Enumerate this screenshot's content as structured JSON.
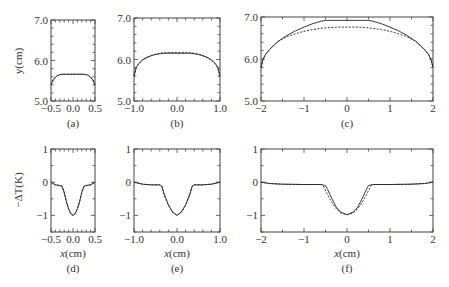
{
  "figure": {
    "ylabel_top": "y(cm)",
    "ylabel_bottom": "−ΔT(K)",
    "xlabel": "x(cm)"
  },
  "chart_data": [
    {
      "id": "a",
      "panel_label": "(a)",
      "type": "line",
      "title": "",
      "xlabel": "",
      "ylabel": "y(cm)",
      "xlim": [
        -0.5,
        0.5
      ],
      "ylim": [
        5.0,
        7.0
      ],
      "xticks": [
        -0.5,
        0.0,
        0.5
      ],
      "xtick_labels": [
        "−0.5",
        "0.0",
        "0.5"
      ],
      "yticks": [
        5.0,
        6.0,
        7.0
      ],
      "ytick_labels": [
        "5.0",
        "6.0",
        "7.0"
      ],
      "x_minor": 0.1,
      "y_minor": 0.2,
      "grid": false,
      "frame": {
        "x": 51,
        "y": 20,
        "w": 44,
        "h": 81
      },
      "series": [
        {
          "name": "solid",
          "style": "solid",
          "x": [
            -0.5,
            -0.45,
            -0.4,
            -0.35,
            -0.3,
            -0.25,
            -0.2,
            -0.1,
            0,
            0.1,
            0.2,
            0.25,
            0.3,
            0.35,
            0.4,
            0.45,
            0.5
          ],
          "y": [
            5.4,
            5.52,
            5.59,
            5.63,
            5.65,
            5.66,
            5.66,
            5.66,
            5.66,
            5.66,
            5.66,
            5.66,
            5.65,
            5.63,
            5.59,
            5.52,
            5.4
          ]
        },
        {
          "name": "dashed",
          "style": "dashed",
          "x": [
            -0.5,
            -0.45,
            -0.4,
            -0.35,
            -0.3,
            -0.25,
            -0.2,
            -0.1,
            0,
            0.1,
            0.2,
            0.25,
            0.3,
            0.35,
            0.4,
            0.45,
            0.5
          ],
          "y": [
            5.4,
            5.52,
            5.59,
            5.63,
            5.65,
            5.66,
            5.66,
            5.66,
            5.66,
            5.66,
            5.66,
            5.66,
            5.65,
            5.63,
            5.59,
            5.52,
            5.4
          ]
        }
      ]
    },
    {
      "id": "b",
      "panel_label": "(b)",
      "type": "line",
      "title": "",
      "xlabel": "",
      "ylabel": "",
      "xlim": [
        -1.0,
        1.0
      ],
      "ylim": [
        5.0,
        7.0
      ],
      "xticks": [
        -1.0,
        0.0,
        1.0
      ],
      "xtick_labels": [
        "−1.0",
        "0.0",
        "1.0"
      ],
      "yticks": [
        5.0,
        6.0,
        7.0
      ],
      "ytick_labels": [
        "5.0",
        "6.0",
        "7.0"
      ],
      "x_minor": 0.2,
      "y_minor": 0.2,
      "grid": false,
      "frame": {
        "x": 134,
        "y": 18,
        "w": 86,
        "h": 83
      },
      "series": [
        {
          "name": "solid",
          "style": "solid",
          "x": [
            -1,
            -0.95,
            -0.9,
            -0.8,
            -0.7,
            -0.6,
            -0.5,
            -0.4,
            -0.3,
            -0.2,
            0,
            0.2,
            0.3,
            0.4,
            0.5,
            0.6,
            0.7,
            0.8,
            0.9,
            0.95,
            1
          ],
          "y": [
            5.6,
            5.8,
            5.89,
            5.99,
            6.05,
            6.09,
            6.12,
            6.14,
            6.15,
            6.15,
            6.15,
            6.15,
            6.15,
            6.14,
            6.12,
            6.09,
            6.05,
            5.99,
            5.89,
            5.8,
            5.6
          ]
        },
        {
          "name": "dashed",
          "style": "dashed",
          "x": [
            -1,
            -0.95,
            -0.9,
            -0.8,
            -0.7,
            -0.6,
            -0.5,
            -0.4,
            -0.3,
            -0.2,
            0,
            0.2,
            0.3,
            0.4,
            0.5,
            0.6,
            0.7,
            0.8,
            0.9,
            0.95,
            1
          ],
          "y": [
            5.6,
            5.8,
            5.89,
            5.99,
            6.05,
            6.1,
            6.13,
            6.15,
            6.16,
            6.17,
            6.17,
            6.17,
            6.16,
            6.15,
            6.13,
            6.1,
            6.05,
            5.99,
            5.89,
            5.8,
            5.6
          ]
        }
      ]
    },
    {
      "id": "c",
      "panel_label": "(c)",
      "type": "line",
      "title": "",
      "xlabel": "",
      "ylabel": "",
      "xlim": [
        -2,
        2
      ],
      "ylim": [
        5.0,
        7.0
      ],
      "xticks": [
        -2,
        -1,
        0,
        1,
        2
      ],
      "xtick_labels": [
        "−2",
        "−1",
        "0",
        "1",
        "2"
      ],
      "yticks": [
        5.0,
        6.0,
        7.0
      ],
      "ytick_labels": [
        "5.0",
        "6.0",
        "7.0"
      ],
      "x_minor": 0.5,
      "y_minor": 0.2,
      "grid": false,
      "frame": {
        "x": 261,
        "y": 17,
        "w": 172,
        "h": 84
      },
      "series": [
        {
          "name": "solid",
          "style": "solid",
          "x": [
            -2,
            -1.95,
            -1.9,
            -1.8,
            -1.6,
            -1.4,
            -1.2,
            -1.0,
            -0.8,
            -0.6,
            -0.5,
            0,
            0.5,
            0.6,
            0.8,
            1.0,
            1.2,
            1.4,
            1.6,
            1.8,
            1.9,
            1.95,
            2
          ],
          "y": [
            5.8,
            6.0,
            6.1,
            6.23,
            6.42,
            6.56,
            6.67,
            6.76,
            6.84,
            6.9,
            6.92,
            6.92,
            6.92,
            6.9,
            6.84,
            6.76,
            6.67,
            6.56,
            6.42,
            6.23,
            6.1,
            6.0,
            5.8
          ]
        },
        {
          "name": "dashed",
          "style": "dashed",
          "x": [
            -2,
            -1.95,
            -1.9,
            -1.8,
            -1.6,
            -1.4,
            -1.2,
            -1.0,
            -0.8,
            -0.6,
            -0.4,
            -0.2,
            0,
            0.2,
            0.4,
            0.6,
            0.8,
            1.0,
            1.2,
            1.4,
            1.6,
            1.8,
            1.9,
            1.95,
            2
          ],
          "y": [
            5.8,
            6.0,
            6.1,
            6.23,
            6.42,
            6.53,
            6.6,
            6.66,
            6.7,
            6.73,
            6.75,
            6.76,
            6.76,
            6.76,
            6.75,
            6.73,
            6.7,
            6.66,
            6.6,
            6.53,
            6.42,
            6.23,
            6.1,
            6.0,
            5.8
          ]
        }
      ]
    },
    {
      "id": "d",
      "panel_label": "(d)",
      "type": "line",
      "title": "",
      "xlabel": "x(cm)",
      "ylabel": "−ΔT(K)",
      "xlim": [
        -0.5,
        0.5
      ],
      "ylim": [
        -1.5,
        1.0
      ],
      "xticks": [
        -0.5,
        0.0,
        0.5
      ],
      "xtick_labels": [
        "−0.5",
        "0.0",
        "0.5"
      ],
      "yticks": [
        -1,
        0,
        1
      ],
      "ytick_labels": [
        "−1",
        "0",
        "1"
      ],
      "x_minor": 0.1,
      "y_minor": 0.5,
      "grid": false,
      "frame": {
        "x": 51,
        "y": 149,
        "w": 44,
        "h": 83
      },
      "series": [
        {
          "name": "solid",
          "style": "solid",
          "x": [
            -0.5,
            -0.4,
            -0.3,
            -0.25,
            -0.2,
            -0.15,
            -0.1,
            -0.05,
            0,
            0.05,
            0.1,
            0.15,
            0.2,
            0.25,
            0.3,
            0.4,
            0.5
          ],
          "y": [
            0.0,
            -0.08,
            -0.1,
            -0.12,
            -0.3,
            -0.58,
            -0.8,
            -0.95,
            -1.0,
            -0.95,
            -0.8,
            -0.58,
            -0.3,
            -0.12,
            -0.1,
            -0.08,
            0.0
          ]
        },
        {
          "name": "dashed",
          "style": "dashed",
          "x": [
            -0.5,
            -0.4,
            -0.3,
            -0.25,
            -0.2,
            -0.15,
            -0.1,
            -0.05,
            0,
            0.05,
            0.1,
            0.15,
            0.2,
            0.25,
            0.3,
            0.4,
            0.5
          ],
          "y": [
            0.0,
            -0.08,
            -0.1,
            -0.12,
            -0.32,
            -0.6,
            -0.81,
            -0.95,
            -1.0,
            -0.95,
            -0.81,
            -0.6,
            -0.32,
            -0.12,
            -0.1,
            -0.08,
            0.0
          ]
        }
      ]
    },
    {
      "id": "e",
      "panel_label": "(e)",
      "type": "line",
      "title": "",
      "xlabel": "x(cm)",
      "ylabel": "",
      "xlim": [
        -1.0,
        1.0
      ],
      "ylim": [
        -1.5,
        1.0
      ],
      "xticks": [
        -1.0,
        0.0,
        1.0
      ],
      "xtick_labels": [
        "−1.0",
        "0.0",
        "1.0"
      ],
      "yticks": [
        -1,
        0,
        1
      ],
      "ytick_labels": [
        "−1",
        "0",
        "1"
      ],
      "x_minor": 0.2,
      "y_minor": 0.5,
      "grid": false,
      "frame": {
        "x": 134,
        "y": 149,
        "w": 86,
        "h": 83
      },
      "series": [
        {
          "name": "solid",
          "style": "solid",
          "x": [
            -1,
            -0.8,
            -0.6,
            -0.4,
            -0.35,
            -0.3,
            -0.2,
            -0.1,
            0,
            0.1,
            0.2,
            0.3,
            0.35,
            0.4,
            0.6,
            0.8,
            1
          ],
          "y": [
            0.0,
            -0.06,
            -0.08,
            -0.08,
            -0.12,
            -0.35,
            -0.68,
            -0.9,
            -1.0,
            -0.9,
            -0.68,
            -0.35,
            -0.12,
            -0.08,
            -0.08,
            -0.06,
            0.0
          ]
        },
        {
          "name": "dashed",
          "style": "dashed",
          "x": [
            -1,
            -0.8,
            -0.6,
            -0.4,
            -0.35,
            -0.3,
            -0.2,
            -0.1,
            0,
            0.1,
            0.2,
            0.3,
            0.35,
            0.4,
            0.6,
            0.8,
            1
          ],
          "y": [
            0.0,
            -0.06,
            -0.08,
            -0.08,
            -0.14,
            -0.38,
            -0.7,
            -0.91,
            -1.0,
            -0.91,
            -0.7,
            -0.38,
            -0.14,
            -0.08,
            -0.08,
            -0.06,
            0.0
          ]
        }
      ]
    },
    {
      "id": "f",
      "panel_label": "(f)",
      "type": "line",
      "title": "",
      "xlabel": "x(cm)",
      "ylabel": "",
      "xlim": [
        -2,
        2
      ],
      "ylim": [
        -1.5,
        1.0
      ],
      "xticks": [
        -2,
        -1,
        0,
        1,
        2
      ],
      "xtick_labels": [
        "−2",
        "−1",
        "0",
        "1",
        "2"
      ],
      "yticks": [
        -1,
        0,
        1
      ],
      "ytick_labels": [
        "−1",
        "0",
        "1"
      ],
      "x_minor": 0.5,
      "y_minor": 0.5,
      "grid": false,
      "frame": {
        "x": 261,
        "y": 149,
        "w": 172,
        "h": 83
      },
      "series": [
        {
          "name": "solid",
          "style": "solid",
          "x": [
            -2,
            -1.8,
            -1.5,
            -1.0,
            -0.6,
            -0.5,
            -0.45,
            -0.35,
            -0.25,
            -0.15,
            0,
            0.15,
            0.25,
            0.35,
            0.45,
            0.5,
            0.6,
            1.0,
            1.5,
            1.8,
            2
          ],
          "y": [
            0.0,
            -0.04,
            -0.06,
            -0.07,
            -0.07,
            -0.1,
            -0.22,
            -0.5,
            -0.75,
            -0.9,
            -0.98,
            -0.9,
            -0.75,
            -0.5,
            -0.22,
            -0.1,
            -0.07,
            -0.07,
            -0.06,
            -0.04,
            0.0
          ]
        },
        {
          "name": "dashed",
          "style": "dashed",
          "x": [
            -2,
            -1.8,
            -1.5,
            -1.0,
            -0.6,
            -0.55,
            -0.45,
            -0.35,
            -0.25,
            -0.15,
            0,
            0.15,
            0.25,
            0.35,
            0.45,
            0.55,
            0.6,
            1.0,
            1.5,
            1.8,
            2
          ],
          "y": [
            0.0,
            -0.04,
            -0.06,
            -0.07,
            -0.07,
            -0.12,
            -0.38,
            -0.62,
            -0.8,
            -0.92,
            -0.98,
            -0.92,
            -0.8,
            -0.62,
            -0.38,
            -0.12,
            -0.07,
            -0.07,
            -0.06,
            -0.04,
            0.0
          ]
        }
      ]
    }
  ]
}
